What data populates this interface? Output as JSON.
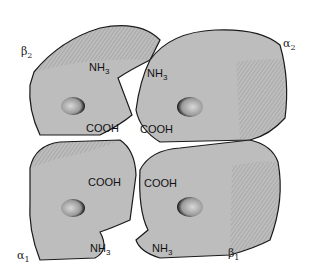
{
  "diagram": {
    "colors": {
      "subunit_fill": "#bdbdbd",
      "shadow": "#8c8c8c",
      "outline": "#1a1a1a",
      "background": "#ffffff"
    },
    "subunits": [
      {
        "id": "beta2",
        "symbol": "β",
        "index": "2",
        "position": "top-left"
      },
      {
        "id": "alpha2",
        "symbol": "α",
        "index": "2",
        "position": "top-right"
      },
      {
        "id": "alpha1",
        "symbol": "α",
        "index": "1",
        "position": "bottom-left"
      },
      {
        "id": "beta1",
        "symbol": "β",
        "index": "1",
        "position": "bottom-right"
      }
    ],
    "termini_labels": [
      {
        "text": "NH",
        "sub": "3",
        "near": "beta2"
      },
      {
        "text": "NH",
        "sub": "3",
        "near": "alpha2"
      },
      {
        "text": "COOH",
        "near": "beta2"
      },
      {
        "text": "COOH",
        "near": "alpha2"
      },
      {
        "text": "COOH",
        "near": "alpha1"
      },
      {
        "text": "COOH",
        "near": "beta1"
      },
      {
        "text": "NH",
        "sub": "3",
        "near": "alpha1"
      },
      {
        "text": "NH",
        "sub": "3",
        "near": "beta1"
      }
    ]
  }
}
